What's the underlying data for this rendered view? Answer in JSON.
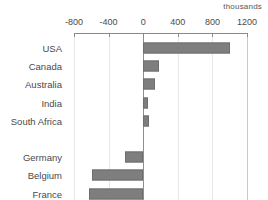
{
  "chart_data": {
    "type": "bar",
    "orientation": "horizontal",
    "title": "",
    "units_label": "thousands",
    "xlabel": "",
    "ylabel": "",
    "xlim": [
      -800,
      1200
    ],
    "xticks": [
      -800,
      -400,
      0,
      400,
      800,
      1200
    ],
    "xtick_labels": [
      "-800",
      "-400",
      "0",
      "400",
      "800",
      "1200"
    ],
    "grid": true,
    "legend": false,
    "zero_line": true,
    "bar_color": "#7e7e7e",
    "categories": [
      "USA",
      "Canada",
      "Australia",
      "India",
      "South Africa",
      "",
      "Germany",
      "Belgium",
      "France"
    ],
    "values": [
      1000,
      185,
      140,
      60,
      70,
      null,
      -215,
      -590,
      -625
    ]
  },
  "colors": {
    "bar_fill": "#7e7e7e",
    "bar_edge": "#6e6e6e",
    "grid": "#e8e8e8",
    "axis": "#8a8a8a",
    "text": "#4a4a4a",
    "background": "#ffffff"
  }
}
